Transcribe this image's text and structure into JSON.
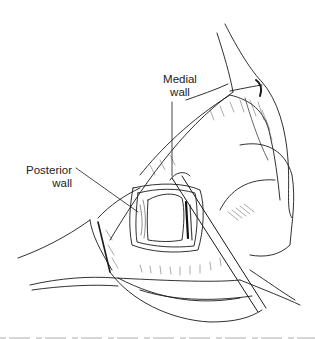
{
  "figure": {
    "type": "surgical-illustration",
    "style": "black ink line drawing",
    "labels": [
      {
        "id": "medial",
        "lines": [
          "Medial",
          "wall"
        ]
      },
      {
        "id": "posterior",
        "lines": [
          "Posterior",
          "wall"
        ]
      }
    ],
    "colors": {
      "ink": "#1a1a1a",
      "background": "#ffffff"
    }
  }
}
